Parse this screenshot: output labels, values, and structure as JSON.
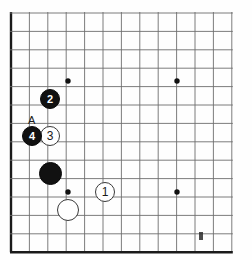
{
  "diagram": {
    "type": "go-board-diagram",
    "board_region": "top-left corner",
    "grid": {
      "origin_x": 11,
      "origin_y": 13,
      "spacing": 18.4,
      "cols": 13,
      "rows": 14,
      "edge_left": true,
      "edge_bottom": true,
      "line_color": "#6e6e6e",
      "edge_color": "#1a1a1a"
    },
    "star_points": [
      {
        "name": "star-point-upper-left",
        "x": 68,
        "y": 81
      },
      {
        "name": "star-point-upper-right",
        "x": 177,
        "y": 81
      },
      {
        "name": "star-point-lower-left",
        "x": 68,
        "y": 192
      },
      {
        "name": "star-point-lower-right",
        "x": 177,
        "y": 192
      }
    ],
    "stones": [
      {
        "name": "stone-white-1",
        "color": "white",
        "label": "1",
        "x": 105,
        "y": 192,
        "size": 20
      },
      {
        "name": "stone-black-2",
        "color": "black",
        "label": "2",
        "x": 50,
        "y": 99,
        "size": 20
      },
      {
        "name": "stone-white-3",
        "color": "white",
        "label": "3",
        "x": 50,
        "y": 136,
        "size": 20
      },
      {
        "name": "stone-black-4",
        "color": "black",
        "label": "4",
        "x": 32,
        "y": 136,
        "size": 20
      },
      {
        "name": "stone-black-plain",
        "color": "black",
        "label": "",
        "x": 50,
        "y": 173,
        "size": 23
      },
      {
        "name": "stone-white-plain",
        "color": "white",
        "label": "",
        "x": 68,
        "y": 210,
        "size": 22
      }
    ],
    "labels": [
      {
        "name": "point-label-a",
        "text": "A",
        "x": 31,
        "y": 120
      }
    ],
    "marks": [
      {
        "name": "scan-artifact-smudge",
        "x": 199,
        "y": 232,
        "width": 4,
        "height": 8
      }
    ]
  }
}
